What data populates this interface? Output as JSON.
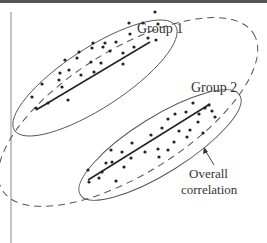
{
  "diagram": {
    "labels": {
      "group1": "Group 1",
      "group2": "Group 2",
      "overall_line1": "Overall",
      "overall_line2": "correlation"
    },
    "colors": {
      "ink": "#333333",
      "dashed": "#555555",
      "background": "#ffffff",
      "top_rule": "#555555"
    },
    "groups": [
      {
        "name": "Group 1",
        "ellipse": {
          "cx": 90,
          "cy": 78,
          "rx": 92,
          "ry": 30,
          "rotate": -32
        },
        "trend_line": {
          "x1": 36,
          "y1": 110,
          "x2": 150,
          "y2": 42
        },
        "points": [
          [
            155,
            12
          ],
          [
            129,
            23
          ],
          [
            143,
            23
          ],
          [
            158,
            24
          ],
          [
            130,
            34
          ],
          [
            148,
            38
          ],
          [
            156,
            40
          ],
          [
            93,
            43
          ],
          [
            105,
            43
          ],
          [
            116,
            42
          ],
          [
            79,
            52
          ],
          [
            92,
            48
          ],
          [
            103,
            47
          ],
          [
            110,
            51
          ],
          [
            123,
            53
          ],
          [
            134,
            47
          ],
          [
            65,
            60
          ],
          [
            77,
            58
          ],
          [
            91,
            62
          ],
          [
            101,
            63
          ],
          [
            123,
            64
          ],
          [
            60,
            73
          ],
          [
            69,
            70
          ],
          [
            59,
            80
          ],
          [
            81,
            75
          ],
          [
            94,
            72
          ],
          [
            42,
            84
          ],
          [
            62,
            87
          ],
          [
            32,
            97
          ],
          [
            48,
            103
          ],
          [
            68,
            100
          ],
          [
            36,
            108
          ]
        ]
      },
      {
        "name": "Group 2",
        "ellipse": {
          "cx": 168,
          "cy": 147,
          "rx": 88,
          "ry": 28,
          "rotate": -32
        },
        "trend_line": {
          "x1": 88,
          "y1": 180,
          "x2": 210,
          "y2": 104
        },
        "points": [
          [
            193,
            103
          ],
          [
            209,
            105
          ],
          [
            205,
            108
          ],
          [
            212,
            111
          ],
          [
            186,
            112
          ],
          [
            199,
            114
          ],
          [
            175,
            114
          ],
          [
            215,
            117
          ],
          [
            198,
            122
          ],
          [
            168,
            119
          ],
          [
            190,
            130
          ],
          [
            162,
            128
          ],
          [
            179,
            131
          ],
          [
            187,
            137
          ],
          [
            203,
            133
          ],
          [
            151,
            135
          ],
          [
            174,
            142
          ],
          [
            132,
            143
          ],
          [
            158,
            149
          ],
          [
            168,
            150
          ],
          [
            145,
            152
          ],
          [
            159,
            157
          ],
          [
            122,
            152
          ],
          [
            131,
            158
          ],
          [
            111,
            150
          ],
          [
            112,
            162
          ],
          [
            124,
            167
          ],
          [
            106,
            163
          ],
          [
            102,
            172
          ],
          [
            88,
            170
          ],
          [
            99,
            178
          ],
          [
            89,
            182
          ],
          [
            116,
            181
          ]
        ]
      }
    ],
    "overall_envelope": {
      "cx": 128,
      "cy": 112,
      "rx": 148,
      "ry": 62,
      "rotate": -32,
      "style": "dashed"
    },
    "arrow": {
      "from": [
        213,
        164
      ],
      "to": [
        204,
        148
      ]
    }
  }
}
